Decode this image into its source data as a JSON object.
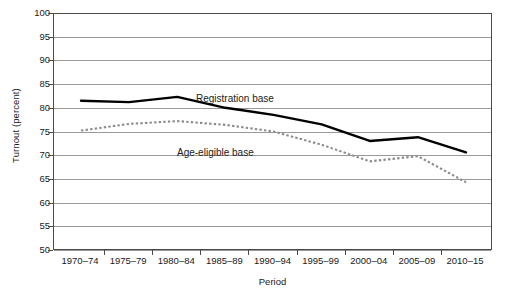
{
  "chart_data": {
    "type": "line",
    "title": "",
    "xlabel": "Period",
    "ylabel": "Turnout (percent)",
    "ylim": [
      50,
      100
    ],
    "ytick_step": 5,
    "grid": true,
    "legend_position": "inline-annotations",
    "categories": [
      "1970–74",
      "1975–79",
      "1980–84",
      "1985–89",
      "1990–94",
      "1995–99",
      "2000–04",
      "2005–09",
      "2010–15"
    ],
    "yticks": [
      50,
      55,
      60,
      65,
      70,
      75,
      80,
      85,
      90,
      95,
      100
    ],
    "series": [
      {
        "name": "Registration base",
        "style": "solid",
        "color": "#000000",
        "values": [
          81.5,
          81.2,
          82.3,
          80.0,
          78.5,
          76.5,
          73.0,
          73.8,
          70.6
        ]
      },
      {
        "name": "Age-eligible base",
        "style": "dotted",
        "color": "#8c8c8c",
        "values": [
          75.2,
          76.6,
          77.2,
          76.4,
          75.0,
          72.2,
          68.7,
          69.8,
          64.3
        ]
      }
    ],
    "annotations": [
      {
        "text": "Registration base",
        "series": "Registration base"
      },
      {
        "text": "Age-eligible base",
        "series": "Age-eligible base"
      }
    ]
  },
  "axes": {
    "y_title": "Turnout (percent)",
    "x_title": "Period"
  }
}
